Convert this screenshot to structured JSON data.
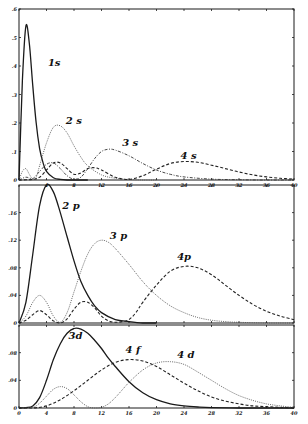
{
  "chart_data": [
    {
      "type": "line",
      "title": "",
      "xlabel": "",
      "ylabel": "",
      "xlim": [
        0,
        40
      ],
      "ylim": [
        0,
        0.6
      ],
      "x_ticks": [
        "4",
        "8",
        "12",
        "16",
        "20",
        "24",
        "28",
        "32",
        "36",
        "40"
      ],
      "y_ticks": [
        "0",
        ".1",
        ".2",
        ".3",
        ".4",
        ".5",
        ".6"
      ],
      "grid": false,
      "series": [
        {
          "name": "1s",
          "style": "solid",
          "x": [
            0,
            0.5,
            1,
            1.5,
            2,
            2.5,
            3,
            3.5,
            4,
            5,
            6,
            7,
            8,
            10
          ],
          "values": [
            0,
            0.35,
            0.54,
            0.48,
            0.33,
            0.2,
            0.11,
            0.06,
            0.03,
            0.008,
            0.002,
            0,
            0,
            0
          ]
        },
        {
          "name": "2s",
          "style": "dotted",
          "x": [
            0,
            0.5,
            1,
            1.5,
            2,
            2.5,
            3,
            4,
            5,
            6,
            7,
            8,
            9,
            10,
            12,
            14,
            16,
            18,
            20
          ],
          "values": [
            0,
            0.03,
            0.04,
            0.02,
            0.003,
            0.01,
            0.05,
            0.13,
            0.185,
            0.19,
            0.165,
            0.12,
            0.08,
            0.05,
            0.018,
            0.006,
            0.002,
            0,
            0
          ]
        },
        {
          "name": "3s",
          "style": "dash-dot",
          "x": [
            0,
            1,
            2,
            3,
            4,
            5,
            6,
            7,
            8,
            9,
            10,
            11,
            12,
            13,
            14,
            16,
            18,
            20,
            22,
            24,
            28,
            32,
            36,
            40
          ],
          "values": [
            0,
            0.01,
            0.005,
            0.03,
            0.055,
            0.06,
            0.04,
            0.015,
            0.003,
            0.01,
            0.04,
            0.075,
            0.1,
            0.108,
            0.105,
            0.085,
            0.058,
            0.035,
            0.02,
            0.011,
            0.003,
            0.001,
            0,
            0
          ]
        },
        {
          "name": "4s",
          "style": "dashed",
          "x": [
            0,
            2,
            3,
            4,
            5,
            6,
            7,
            8,
            9,
            10,
            11,
            12,
            14,
            16,
            18,
            20,
            22,
            24,
            26,
            28,
            30,
            32,
            34,
            36,
            38,
            40
          ],
          "values": [
            0,
            0.002,
            0.01,
            0.035,
            0.06,
            0.06,
            0.04,
            0.02,
            0.025,
            0.04,
            0.043,
            0.035,
            0.01,
            0.002,
            0.015,
            0.038,
            0.058,
            0.065,
            0.062,
            0.052,
            0.04,
            0.028,
            0.018,
            0.011,
            0.006,
            0.003
          ]
        }
      ],
      "annotations": [
        "1s",
        "2 s",
        "3 s",
        "4 s"
      ]
    },
    {
      "type": "line",
      "title": "",
      "xlabel": "",
      "ylabel": "",
      "xlim": [
        0,
        40
      ],
      "ylim": [
        0,
        0.2
      ],
      "x_ticks": [],
      "y_ticks": [
        "0",
        ".04",
        ".08",
        ".12",
        ".16"
      ],
      "grid": false,
      "series": [
        {
          "name": "2p",
          "style": "solid",
          "x": [
            0,
            1,
            2,
            3,
            4,
            5,
            6,
            7,
            8,
            9,
            10,
            11,
            12,
            14,
            16,
            18,
            20
          ],
          "values": [
            0,
            0.03,
            0.1,
            0.17,
            0.2,
            0.19,
            0.16,
            0.125,
            0.09,
            0.06,
            0.04,
            0.025,
            0.015,
            0.005,
            0.002,
            0,
            0
          ]
        },
        {
          "name": "3p",
          "style": "dotted",
          "x": [
            0,
            1,
            2,
            3,
            4,
            5,
            6,
            7,
            8,
            9,
            10,
            11,
            12,
            13,
            14,
            16,
            18,
            20,
            22,
            24,
            26,
            28,
            30,
            32,
            36,
            40
          ],
          "values": [
            0,
            0.01,
            0.03,
            0.04,
            0.03,
            0.01,
            0.001,
            0.015,
            0.045,
            0.075,
            0.1,
            0.115,
            0.12,
            0.117,
            0.108,
            0.085,
            0.06,
            0.04,
            0.025,
            0.015,
            0.008,
            0.004,
            0.002,
            0.001,
            0,
            0
          ]
        },
        {
          "name": "4p",
          "style": "dashed",
          "x": [
            0,
            1,
            2,
            3,
            4,
            5,
            6,
            7,
            8,
            9,
            10,
            11,
            12,
            13,
            14,
            15,
            16,
            17,
            18,
            20,
            22,
            24,
            26,
            28,
            30,
            32,
            34,
            36,
            38,
            40
          ],
          "values": [
            0,
            0.004,
            0.012,
            0.018,
            0.012,
            0.003,
            0,
            0.006,
            0.02,
            0.03,
            0.03,
            0.022,
            0.01,
            0.003,
            0.001,
            0.002,
            0.005,
            0.015,
            0.03,
            0.055,
            0.075,
            0.082,
            0.08,
            0.07,
            0.055,
            0.04,
            0.027,
            0.017,
            0.01,
            0.005
          ]
        }
      ],
      "annotations": [
        "2 p",
        "3 p",
        "4p"
      ]
    },
    {
      "type": "line",
      "title": "",
      "xlabel": "",
      "ylabel": "",
      "xlim": [
        0,
        40
      ],
      "ylim": [
        0,
        0.12
      ],
      "x_ticks": [
        "0",
        "4",
        "8",
        "12",
        "16",
        "20",
        "24",
        "28",
        "32",
        "36",
        "40"
      ],
      "y_ticks": [
        "0",
        ".04",
        ".08"
      ],
      "grid": false,
      "series": [
        {
          "name": "3d",
          "style": "solid",
          "x": [
            0,
            1,
            2,
            3,
            4,
            5,
            6,
            7,
            8,
            9,
            10,
            11,
            12,
            13,
            14,
            16,
            18,
            20,
            22,
            24,
            26,
            28,
            32,
            36,
            40
          ],
          "values": [
            0,
            0.0005,
            0.003,
            0.015,
            0.04,
            0.07,
            0.093,
            0.108,
            0.115,
            0.114,
            0.108,
            0.098,
            0.086,
            0.072,
            0.06,
            0.038,
            0.022,
            0.012,
            0.006,
            0.003,
            0.0015,
            0.0005,
            0,
            0,
            0
          ]
        },
        {
          "name": "4d",
          "style": "dotted",
          "x": [
            0,
            2,
            3,
            4,
            5,
            6,
            7,
            8,
            9,
            10,
            11,
            12,
            13,
            14,
            15,
            16,
            18,
            20,
            22,
            24,
            26,
            28,
            30,
            32,
            34,
            36,
            38,
            40
          ],
          "values": [
            0,
            0.001,
            0.007,
            0.017,
            0.027,
            0.031,
            0.028,
            0.019,
            0.009,
            0.002,
            0,
            0.001,
            0.006,
            0.015,
            0.026,
            0.037,
            0.055,
            0.065,
            0.067,
            0.063,
            0.052,
            0.04,
            0.028,
            0.018,
            0.011,
            0.006,
            0.003,
            0.001
          ]
        },
        {
          "name": "4f",
          "style": "dashed",
          "x": [
            0,
            2,
            4,
            6,
            8,
            10,
            12,
            14,
            16,
            18,
            20,
            22,
            24,
            26,
            28,
            30,
            32,
            34,
            36,
            38,
            40
          ],
          "values": [
            0,
            0,
            0.003,
            0.012,
            0.025,
            0.04,
            0.055,
            0.066,
            0.07,
            0.068,
            0.06,
            0.048,
            0.036,
            0.025,
            0.016,
            0.01,
            0.006,
            0.003,
            0.002,
            0.001,
            0
          ]
        }
      ],
      "annotations": [
        "3d",
        "4 f",
        "4 d"
      ]
    }
  ],
  "panels": [
    {
      "labels": [
        {
          "text": "1s",
          "x": 4.2,
          "y": 0.4
        },
        {
          "text": "2 s",
          "x": 6.8,
          "y": 0.195
        },
        {
          "text": "3 s",
          "x": 15.0,
          "y": 0.118
        },
        {
          "text": "4 s",
          "x": 23.5,
          "y": 0.075
        }
      ]
    },
    {
      "labels": [
        {
          "text": "2 p",
          "x": 6.3,
          "y": 0.165
        },
        {
          "text": "3 p",
          "x": 13.2,
          "y": 0.122
        },
        {
          "text": "4p",
          "x": 23.0,
          "y": 0.092
        }
      ]
    },
    {
      "labels": [
        {
          "text": "3d",
          "x": 7.2,
          "y": 0.1
        },
        {
          "text": "4 f",
          "x": 15.5,
          "y": 0.08
        },
        {
          "text": "4 d",
          "x": 23.0,
          "y": 0.072
        }
      ]
    }
  ]
}
